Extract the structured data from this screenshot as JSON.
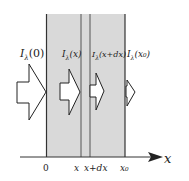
{
  "diagram": {
    "intensity_labels": [
      {
        "symbol": "I",
        "subscript": "λ",
        "arg": "(0)"
      },
      {
        "symbol": "I",
        "subscript": "λ",
        "arg": "(x)"
      },
      {
        "symbol": "I",
        "subscript": "λ",
        "arg": "(x+dx)"
      },
      {
        "symbol": "I",
        "subscript": "λ",
        "arg": "(x₀)"
      }
    ],
    "axis": {
      "label": "x",
      "ticks": [
        "0",
        "x",
        "x+dx",
        "x₀"
      ]
    },
    "colors": {
      "slab": "#d9d9d9",
      "line": "#333333",
      "arrow_fill": "#ffffff"
    }
  }
}
